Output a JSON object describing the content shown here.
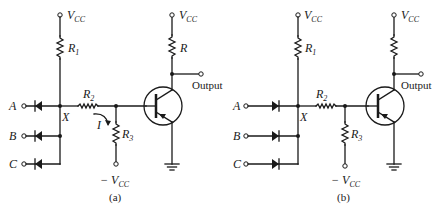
{
  "figure": {
    "panels": [
      {
        "id": "a",
        "caption": "(a)",
        "supply_top_left": "V",
        "supply_sub": "CC",
        "r1": "R",
        "r1_sub": "1",
        "r2": "R",
        "r2_sub": "2",
        "r3": "R",
        "r3_sub": "3",
        "rc": "R",
        "node": "X",
        "current": "I",
        "neg_supply": "− V",
        "neg_supply_sub": "CC",
        "output": "Output",
        "inputs": [
          "A",
          "B",
          "C"
        ],
        "diode_direction": "cathode-toward-input"
      },
      {
        "id": "b",
        "caption": "(b)",
        "supply_top_left": "V",
        "supply_sub": "CC",
        "r1": "R",
        "r1_sub": "1",
        "r2": "R",
        "r2_sub": "2",
        "r3": "R",
        "r3_sub": "3",
        "node": "X",
        "neg_supply": "− V",
        "neg_supply_sub": "CC",
        "output": "Output",
        "inputs": [
          "A",
          "B",
          "C"
        ],
        "diode_direction": "anode-toward-input"
      }
    ]
  }
}
